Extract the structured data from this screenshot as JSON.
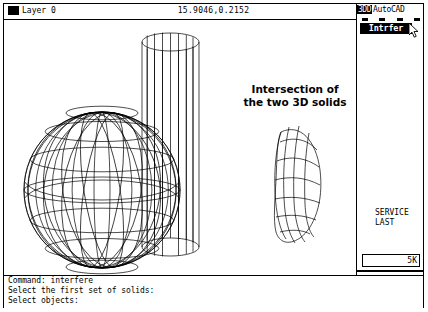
{
  "window": {
    "application": "AutoCAD"
  },
  "statusbar": {
    "layer_label": "Layer 0",
    "layer_color_swatch": "#000000",
    "coordinates": "15.9046,0.2152"
  },
  "sidemenu": {
    "tag_label": "3DD",
    "app_label": "AutoCAD",
    "dash_count": 4,
    "selected_item": "Intrfer",
    "service_lines": [
      "SERVICE",
      "LAST"
    ],
    "memory_indicator": "5K",
    "cursor": "arrow-pointer"
  },
  "canvas": {
    "annotation": "Intersection of\nthe two 3D solids",
    "annotation_line1": "Intersection of",
    "annotation_line2": "the two 3D solids",
    "objects": [
      {
        "name": "wireframe-sphere",
        "type": "sphere"
      },
      {
        "name": "wireframe-cylinder",
        "type": "cylinder"
      },
      {
        "name": "intersection-solid",
        "type": "lens"
      }
    ],
    "line_color": "#000000",
    "background": "#ffffff"
  },
  "commandline": {
    "lines": [
      "Command: interfere",
      "Select the first set of solids:",
      "Select objects:"
    ],
    "line0": "Command: interfere",
    "line1": "Select the first set of solids:",
    "line2": "Select objects:"
  }
}
